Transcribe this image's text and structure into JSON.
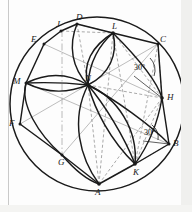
{
  "figure": {
    "type": "geometric-construction",
    "canvas": {
      "width": 192,
      "height": 212
    },
    "circle": {
      "cx": 97,
      "cy": 104,
      "r": 87,
      "stroke": "#1a1a1a"
    },
    "colors": {
      "ink": "#1a1a1a",
      "construction": "#9a9a9a",
      "dashed": "#8c8c8c",
      "background": "#fdfdfd",
      "margin_rule": "#c9c9c9"
    },
    "vertices": [
      {
        "name": "D",
        "x": 77,
        "y": 24,
        "label_dx": -1,
        "label_dy": -11
      },
      {
        "name": "J",
        "x": 61,
        "y": 31,
        "label_dx": -3,
        "label_dy": -11
      },
      {
        "name": "E",
        "x": 44,
        "y": 44,
        "label_dx": -11,
        "label_dy": -5
      },
      {
        "name": "M",
        "x": 26,
        "y": 83,
        "label_dx": -11,
        "label_dy": -2
      },
      {
        "name": "F",
        "x": 20,
        "y": 124,
        "label_dx": -11,
        "label_dy": 0
      },
      {
        "name": "G",
        "x": 62,
        "y": 155,
        "label_dx": -2,
        "label_dy": 5
      },
      {
        "name": "A",
        "x": 99,
        "y": 184,
        "label_dx": -2,
        "label_dy": 5
      },
      {
        "name": "K",
        "x": 135,
        "y": 164,
        "label_dx": -1,
        "label_dy": 5
      },
      {
        "name": "B",
        "x": 169,
        "y": 144,
        "label_dx": 4,
        "label_dy": -2
      },
      {
        "name": "H",
        "x": 162,
        "y": 98,
        "label_dx": 5,
        "label_dy": -2
      },
      {
        "name": "C",
        "x": 158,
        "y": 44,
        "label_dx": 4,
        "label_dy": -6
      },
      {
        "name": "L",
        "x": 113,
        "y": 33,
        "label_dx": -1,
        "label_dy": -10
      },
      {
        "name": "N",
        "x": 88,
        "y": 85,
        "label_dx": -3,
        "label_dy": -9
      }
    ],
    "angle_labels": [
      {
        "text": "30°",
        "x": 135,
        "y": 69
      },
      {
        "text": "30°",
        "x": 145,
        "y": 134
      }
    ],
    "hub_points": [
      "N",
      "H",
      "K",
      "A",
      "L"
    ]
  }
}
